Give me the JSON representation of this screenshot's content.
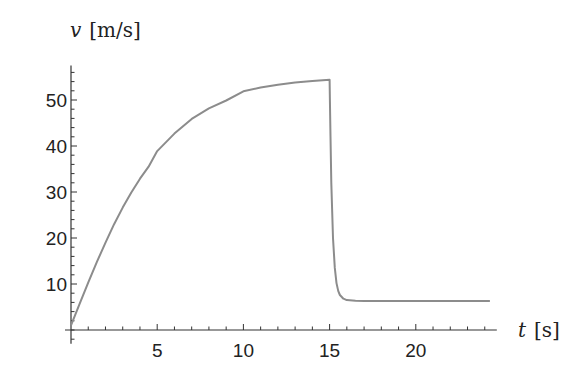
{
  "chart_data": {
    "type": "line",
    "title": "",
    "xlabel": "t [s]",
    "ylabel": "v [m/s]",
    "xlabel_var": "t",
    "xlabel_unit": "[s]",
    "ylabel_var": "v",
    "ylabel_unit": "[m/s]",
    "xlim": [
      0,
      24.7
    ],
    "ylim": [
      -3,
      57.5
    ],
    "xticks": [
      5,
      10,
      15,
      20
    ],
    "yticks": [
      10,
      20,
      30,
      40,
      50
    ],
    "grid": false,
    "legend": null,
    "line_color": "#8c8c8c",
    "series": [
      {
        "name": "velocity",
        "x": [
          0,
          0.5,
          1,
          1.5,
          2,
          2.5,
          3,
          3.5,
          4,
          4.5,
          5,
          6,
          7,
          8,
          9,
          10,
          11,
          12,
          13,
          14,
          15,
          15.02,
          15.05,
          15.1,
          15.2,
          15.3,
          15.4,
          15.5,
          15.6,
          15.8,
          16,
          16.5,
          17,
          18,
          20,
          22,
          24.3
        ],
        "values": [
          1.0,
          5.7,
          10.3,
          14.8,
          19.0,
          23.0,
          26.6,
          29.9,
          32.9,
          35.5,
          38.9,
          42.7,
          45.9,
          48.2,
          49.9,
          51.9,
          52.7,
          53.3,
          53.8,
          54.1,
          54.4,
          50,
          42,
          32,
          20,
          13.5,
          10.2,
          8.5,
          7.6,
          6.8,
          6.5,
          6.35,
          6.3,
          6.3,
          6.3,
          6.3,
          6.3
        ]
      }
    ]
  }
}
